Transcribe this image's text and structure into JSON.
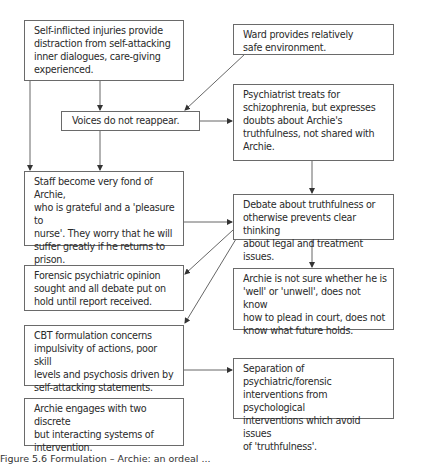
{
  "diagram": {
    "type": "flowchart",
    "nodes": [
      {
        "id": "self_injury",
        "text": "Self-inflicted injuries provide distraction from self-attacking inner dialogues, care-giving experienced."
      },
      {
        "id": "ward",
        "text": "Ward provides relatively safe environment."
      },
      {
        "id": "voices",
        "text": "Voices do not reappear."
      },
      {
        "id": "psychiatrist",
        "text": "Psychiatrist treats for schizophrenia, but expresses doubts about Archie's truthfulness, not shared with Archie."
      },
      {
        "id": "staff",
        "text": "Staff become very fond of Archie, who is grateful and a 'pleasure to nurse'. They worry that he will suffer greatly if he returns to prison."
      },
      {
        "id": "debate",
        "text": "Debate about truthfulness or otherwise prevents clear thinking about legal and treatment issues."
      },
      {
        "id": "forensic",
        "text": "Forensic psychiatric opinion sought and all debate put on hold until report received."
      },
      {
        "id": "archie_unsure",
        "text": "Archie is not sure whether he is 'well' or 'unwell', does not know how to plead in court, does not know what future holds."
      },
      {
        "id": "cbt",
        "text": "CBT formulation concerns impulsivity of actions, poor skill levels and psychosis driven by self-attacking statements."
      },
      {
        "id": "separation",
        "text": "Separation of psychiatric/forensic interventions from psychological interventions which avoid issues of 'truthfulness'."
      },
      {
        "id": "archie_engages",
        "text": "Archie engages with two discrete but interacting systems of intervention."
      }
    ],
    "edges": [
      {
        "from": "self_injury",
        "to": "voices"
      },
      {
        "from": "self_injury",
        "to": "staff"
      },
      {
        "from": "ward",
        "to": "voices"
      },
      {
        "from": "voices",
        "to": "staff"
      },
      {
        "from": "voices",
        "to": "psychiatrist"
      },
      {
        "from": "psychiatrist",
        "to": "debate"
      },
      {
        "from": "staff",
        "to": "debate"
      },
      {
        "from": "debate",
        "to": "archie_unsure"
      },
      {
        "from": "debate",
        "to": "forensic"
      },
      {
        "from": "debate",
        "to": "cbt"
      },
      {
        "from": "cbt",
        "to": "separation"
      }
    ]
  },
  "boxes": {
    "self_injury": [
      "Self-inflicted injuries provide",
      "distraction from self-attacking",
      "inner dialogues, care-giving",
      "experienced."
    ],
    "ward": [
      "Ward provides relatively",
      "safe environment."
    ],
    "voices": [
      "Voices do not reappear."
    ],
    "psychiatrist": [
      "Psychiatrist treats for",
      "schizophrenia, but expresses",
      "doubts about Archie's",
      "truthfulness, not shared with",
      "Archie."
    ],
    "staff": [
      "Staff become very fond of Archie,",
      "who is grateful and a 'pleasure to",
      "nurse'. They worry that he will",
      "suffer greatly if he returns to",
      "prison."
    ],
    "debate": [
      "Debate about truthfulness or",
      "otherwise prevents clear thinking",
      "about legal and treatment issues."
    ],
    "forensic": [
      "Forensic psychiatric opinion",
      "sought and all debate put on",
      "hold until report received."
    ],
    "archie_unsure": [
      "Archie is not sure whether he is",
      "'well' or 'unwell', does not know",
      "how to plead in court, does not",
      "know what future holds."
    ],
    "cbt": [
      "CBT formulation concerns",
      "impulsivity of actions, poor skill",
      "levels and psychosis driven by",
      "self-attacking statements."
    ],
    "separation": [
      "Separation of psychiatric/forensic",
      "interventions from psychological",
      "interventions which avoid issues",
      "of 'truthfulness'."
    ],
    "archie_engages": [
      "Archie engages with two discrete",
      "but interacting systems of",
      "intervention."
    ]
  },
  "caption": "Figure 5.6 Formulation – Archie: an ordeal ..."
}
